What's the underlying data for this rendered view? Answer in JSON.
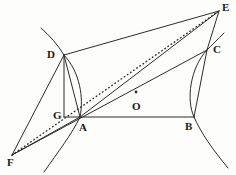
{
  "figure": {
    "width": 236,
    "height": 175,
    "background_color": "#fdfdfb",
    "stroke_color": "#2b2b2b",
    "label_color": "#1a1a1a"
  },
  "points": [
    {
      "id": "A",
      "label": "A",
      "x": 80,
      "y": 117,
      "label_x": 79,
      "label_y": 122,
      "marked_dot": false
    },
    {
      "id": "B",
      "label": "B",
      "x": 194,
      "y": 117,
      "label_x": 185,
      "label_y": 121,
      "marked_dot": false
    },
    {
      "id": "C",
      "label": "C",
      "x": 207,
      "y": 50,
      "label_x": 213,
      "label_y": 44,
      "marked_dot": false
    },
    {
      "id": "D",
      "label": "D",
      "x": 64,
      "y": 55,
      "label_x": 47,
      "label_y": 49,
      "marked_dot": false
    },
    {
      "id": "E",
      "label": "E",
      "x": 219,
      "y": 11,
      "label_x": 222,
      "label_y": 2,
      "marked_dot": false
    },
    {
      "id": "F",
      "label": "F",
      "x": 12,
      "y": 155,
      "label_x": 7,
      "label_y": 157,
      "marked_dot": false
    },
    {
      "id": "G",
      "label": "G",
      "x": 64,
      "y": 117,
      "label_x": 53,
      "label_y": 110,
      "marked_dot": false
    },
    {
      "id": "O",
      "label": "O",
      "x": 136,
      "y": 99,
      "label_x": 132,
      "label_y": 101,
      "marked_dot": true
    }
  ],
  "solid_segments": [
    {
      "name": "segment-D-E",
      "from": "D",
      "to": "E"
    },
    {
      "name": "segment-E-C",
      "from": "E",
      "to": "C"
    },
    {
      "name": "segment-C-B",
      "from": "C",
      "to": "B"
    },
    {
      "name": "segment-B-A",
      "from": "B",
      "to": "A"
    },
    {
      "name": "segment-A-D-vertical",
      "from": "A",
      "to": "D"
    },
    {
      "name": "segment-G-A",
      "from": "G",
      "to": "A"
    },
    {
      "name": "segment-G-D",
      "from": "G",
      "to": "D"
    },
    {
      "name": "segment-F-C",
      "from": "F",
      "to": "C"
    },
    {
      "name": "segment-F-D",
      "from": "F",
      "to": "D"
    },
    {
      "name": "segment-F-A",
      "from": "F",
      "to": "A"
    },
    {
      "name": "segment-A-E",
      "from": "A",
      "to": "E"
    }
  ],
  "dotted_segments": [
    {
      "name": "dotted-diagonal-F-E",
      "from": "F",
      "to": "E"
    }
  ],
  "curves": [
    {
      "name": "hyperbola-arc-left",
      "description": "arc through D, bulging right, passing near A",
      "path": "M 64 55 C 80 72, 84 98, 80 117"
    },
    {
      "name": "hyperbola-arc-right",
      "description": "arc through C, bulging left, passing through B",
      "path": "M 207 50 C 190 68, 186 100, 194 117"
    },
    {
      "name": "hyperbola-branch-lower-left",
      "description": "curve continuing down-right from A region",
      "path": "M 80 117 C 72 134, 58 152, 44 172"
    },
    {
      "name": "hyperbola-branch-upper-left",
      "description": "curve continuing up-left above D",
      "path": "M 64 55 C 58 45, 50 36, 41 28"
    },
    {
      "name": "hyperbola-branch-lower-right",
      "description": "curve continuing down-right from B",
      "path": "M 194 117 C 201 133, 213 150, 228 168"
    },
    {
      "name": "hyperbola-branch-upper-right",
      "description": "short tangent stub above C",
      "path": "M 207 50 C 212 45, 218 39, 224 33"
    }
  ]
}
